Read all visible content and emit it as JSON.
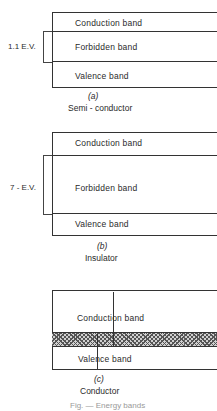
{
  "figure": {
    "panels": [
      {
        "id": "a",
        "label": "(a)",
        "title": "Semi - conductor",
        "gap_label": "1.1 E.V.",
        "bands": [
          "Conduction band",
          "Forbidden band",
          "Valence band"
        ]
      },
      {
        "id": "b",
        "label": "(b)",
        "title": "Insulator",
        "gap_label": "7 - E.V.",
        "bands": [
          "Conduction band",
          "Forbidden band",
          "Valence band"
        ]
      },
      {
        "id": "c",
        "label": "(c)",
        "title": "Conductor",
        "bands": [
          "Conduction band",
          "Valence band"
        ],
        "overlap": "hatched overlap region"
      }
    ],
    "caption": "Fig. — Energy bands"
  }
}
